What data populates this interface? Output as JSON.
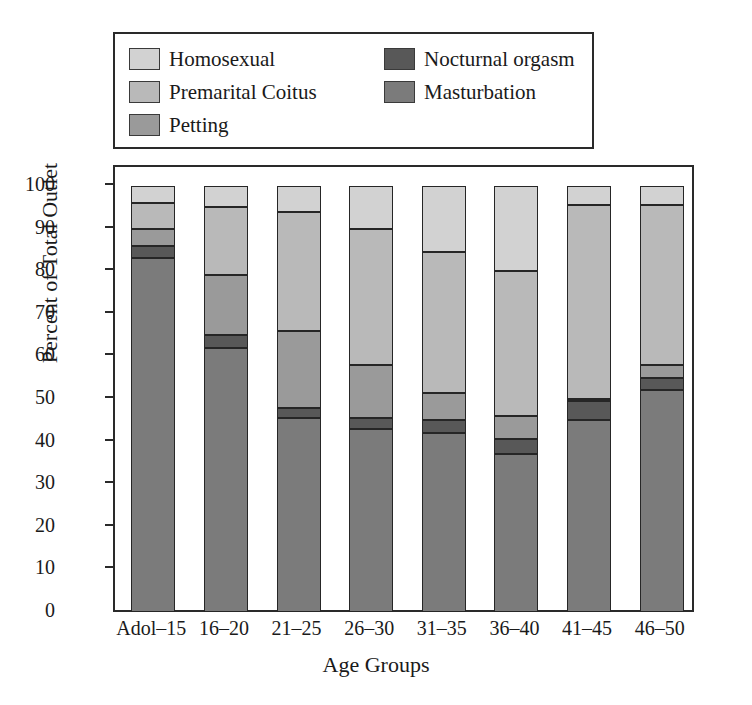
{
  "legend": {
    "items": [
      {
        "label": "Homosexual",
        "color": "#d2d2d2",
        "column": 1
      },
      {
        "label": "Premarital Coitus",
        "color": "#b9b9b9",
        "column": 1
      },
      {
        "label": "Petting",
        "color": "#9a9a9a",
        "column": 1
      },
      {
        "label": "Nocturnal orgasm",
        "color": "#585858",
        "column": 2
      },
      {
        "label": "Masturbation",
        "color": "#7b7b7b",
        "column": 2
      }
    ]
  },
  "axes": {
    "y_label": "Percent of Total Outlet",
    "x_label": "Age Groups",
    "y_ticks": [
      "100",
      "90",
      "80",
      "70",
      "60",
      "50",
      "40",
      "30",
      "20",
      "10",
      "0"
    ],
    "y_min": 0,
    "y_max": 100
  },
  "chart_data": {
    "type": "bar",
    "stacked": true,
    "title": "",
    "xlabel": "Age Groups",
    "ylabel": "Percent of Total Outlet",
    "ylim": [
      0,
      100
    ],
    "grid": false,
    "legend_position": "top",
    "categories": [
      "Adol–15",
      "16–20",
      "21–25",
      "26–30",
      "31–35",
      "36–40",
      "41–45",
      "46–50"
    ],
    "series": [
      {
        "name": "Masturbation",
        "color": "#7b7b7b",
        "values": [
          83,
          62,
          45.5,
          43,
          42,
          37,
          45,
          52
        ]
      },
      {
        "name": "Nocturnal orgasm",
        "color": "#585858",
        "values": [
          3,
          3,
          2.5,
          2.5,
          3,
          3.5,
          4.5,
          3
        ]
      },
      {
        "name": "Petting",
        "color": "#9a9a9a",
        "values": [
          4,
          14,
          18,
          12.5,
          6.5,
          5.5,
          0.5,
          3
        ]
      },
      {
        "name": "Premarital Coitus",
        "color": "#b9b9b9",
        "values": [
          6,
          16,
          28,
          32,
          33,
          34,
          45.5,
          37.5
        ]
      },
      {
        "name": "Homosexual",
        "color": "#d2d2d2",
        "values": [
          4,
          5,
          6,
          10,
          15,
          20,
          4.5,
          4.5
        ]
      }
    ],
    "stack_tops": [
      [
        83,
        86,
        90,
        96,
        100
      ],
      [
        62,
        65,
        79,
        95,
        100
      ],
      [
        45.5,
        48,
        66,
        94,
        100
      ],
      [
        43,
        45.5,
        58,
        90,
        100
      ],
      [
        42,
        45,
        51.5,
        84.5,
        100
      ],
      [
        37,
        40.5,
        46,
        80,
        100
      ],
      [
        45,
        49.5,
        50,
        95.5,
        100
      ],
      [
        52,
        55,
        58,
        95.5,
        100
      ]
    ]
  }
}
